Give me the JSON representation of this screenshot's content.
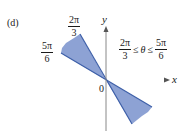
{
  "figure": {
    "panel_label": "(d)",
    "axes": {
      "x_label": "x",
      "y_label": "y",
      "origin_label": "0"
    },
    "angle_labels": {
      "upper": {
        "num": "2π",
        "den": "3"
      },
      "lower": {
        "num": "5π",
        "den": "6"
      }
    },
    "inequality": {
      "left": {
        "num": "2π",
        "den": "3"
      },
      "op1": "≤",
      "var": "θ",
      "op2": "≤",
      "right": {
        "num": "5π",
        "den": "6"
      }
    },
    "colors": {
      "region_fill": "#8da2d4",
      "region_edge": "#3d5fa8",
      "axis": "#777777"
    }
  }
}
